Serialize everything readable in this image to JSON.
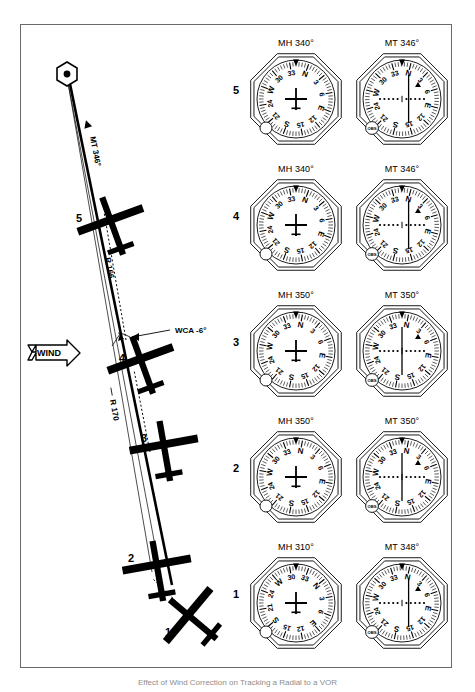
{
  "figure": {
    "caption": "Effect of Wind Correction on Tracking a Radial to a VOR",
    "border_color": "#6a6a6a"
  },
  "map": {
    "station": {
      "name": "vor-station",
      "symbol": "hexagon-with-dot"
    },
    "wind": {
      "label": "WIND",
      "direction": "from-the-west"
    },
    "labels": {
      "mt_course": "MT 346°",
      "radial_166": "R 166",
      "radial_170": "R 170",
      "wca": "WCA -6°"
    },
    "aircraft": [
      {
        "id": "1",
        "label": "1",
        "heading_deg": 310
      },
      {
        "id": "2",
        "label": "2",
        "heading_deg": 350
      },
      {
        "id": "3",
        "label": "3",
        "heading_deg": 350
      },
      {
        "id": "4",
        "label": "4",
        "heading_deg": 340
      },
      {
        "id": "5",
        "label": "5",
        "heading_deg": 340
      }
    ]
  },
  "panels": {
    "knob_label": "OBS",
    "rows": [
      {
        "index": "5",
        "hi": {
          "title": "MH 340°",
          "card_rotation_deg": 340
        },
        "vor": {
          "title": "MT 346°",
          "card_rotation_deg": 346,
          "cdi_deflection": "right-of-center",
          "flag": "TO"
        }
      },
      {
        "index": "4",
        "hi": {
          "title": "MH 340°",
          "card_rotation_deg": 340
        },
        "vor": {
          "title": "MT 346°",
          "card_rotation_deg": 346,
          "cdi_deflection": "right-of-center",
          "flag": "TO"
        }
      },
      {
        "index": "3",
        "hi": {
          "title": "MH 350°",
          "card_rotation_deg": 350
        },
        "vor": {
          "title": "MT 350°",
          "card_rotation_deg": 350,
          "cdi_deflection": "centered",
          "flag": "TO"
        }
      },
      {
        "index": "2",
        "hi": {
          "title": "MH 350°",
          "card_rotation_deg": 350
        },
        "vor": {
          "title": "MT 350°",
          "card_rotation_deg": 350,
          "cdi_deflection": "centered",
          "flag": "TO"
        }
      },
      {
        "index": "1",
        "hi": {
          "title": "MH 310°",
          "card_rotation_deg": 310
        },
        "vor": {
          "title": "MT 348°",
          "card_rotation_deg": 348,
          "cdi_deflection": "right-of-center",
          "flag": "TO"
        }
      }
    ]
  }
}
